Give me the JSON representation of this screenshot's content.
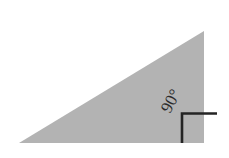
{
  "figure": {
    "name": "right-triangle-diagram",
    "background_color": "#ffffff",
    "canvas": {
      "width": 229,
      "height": 158
    }
  },
  "triangle": {
    "name": "shaded-right-triangle",
    "fill_color": "#b3b3b3",
    "stroke_color": "none",
    "vertices": [
      {
        "label": "bottom-left",
        "x": 19,
        "y": 143
      },
      {
        "label": "bottom-right",
        "x": 204,
        "y": 143
      },
      {
        "label": "top-right",
        "x": 204,
        "y": 31
      }
    ],
    "points_attr": "19,143 204,143 204,31"
  },
  "right_angle_marker": {
    "name": "right-angle-square",
    "stroke_color": "#242424",
    "stroke_width": 2.6,
    "path": "M 182,143 L 182,113.5 L 217,113.5",
    "corner": {
      "x": 182,
      "y": 113.5
    }
  },
  "angle_label": {
    "name": "angle-measure-label",
    "text": "90°",
    "value": 90,
    "unit": "degrees",
    "color": "#2b2b2b",
    "x": 170,
    "y": 114,
    "rotation_deg": -62,
    "font_size_px": 17
  }
}
